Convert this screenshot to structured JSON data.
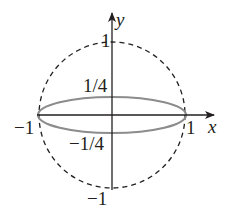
{
  "diagram": {
    "axes": {
      "x_label": "x",
      "y_label": "y"
    },
    "tick_labels": {
      "y_top": "1",
      "y_bottom": "−1",
      "x_left": "−1",
      "x_right": "1",
      "ellipse_top": "1/4",
      "ellipse_bottom": "−1/4"
    },
    "shapes": {
      "circle": {
        "center": [
          0,
          0
        ],
        "radius": 1,
        "style": "dashed",
        "color": "#231f20"
      },
      "ellipse": {
        "center": [
          0,
          0
        ],
        "semi_axis_x": 1,
        "semi_axis_y": 0.25,
        "style": "solid",
        "color": "#8a8a8a"
      }
    },
    "colors": {
      "axis": "#231f20",
      "circle": "#231f20",
      "ellipse": "#8c8c8c",
      "text": "#231f20"
    }
  }
}
